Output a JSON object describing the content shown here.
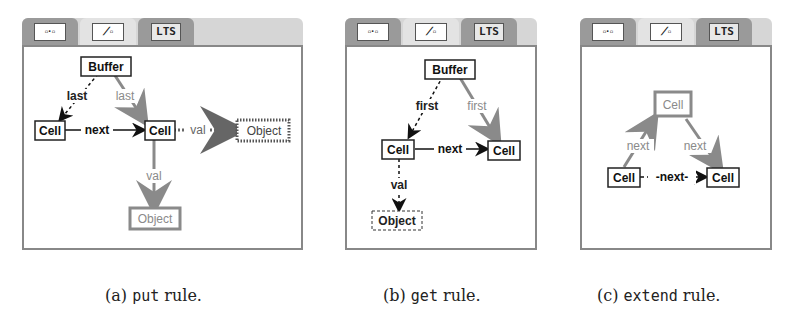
{
  "tabs": {
    "rule_view_icon": "rule-graph",
    "type_view_icon": "type-graph",
    "lts_label": "LTS"
  },
  "panels": [
    {
      "id": "a",
      "nodes": {
        "buffer": "Buffer",
        "cell_left": "Cell",
        "cell_mid": "Cell",
        "object_right": "Object",
        "object_bottom": "Object"
      },
      "edges": {
        "last_erased": "last",
        "last_created": "last",
        "next": "next",
        "val_nac": "val",
        "val_created": "val"
      },
      "caption": {
        "letter": "(a)",
        "rule": "put",
        "suffix": "rule."
      }
    },
    {
      "id": "b",
      "nodes": {
        "buffer": "Buffer",
        "cell_left": "Cell",
        "cell_right": "Cell",
        "object": "Object"
      },
      "edges": {
        "first_erased": "first",
        "first_created": "first",
        "next": "next",
        "val_erased": "val"
      },
      "caption": {
        "letter": "(b)",
        "rule": "get",
        "suffix": "rule."
      }
    },
    {
      "id": "c",
      "nodes": {
        "cell_top": "Cell",
        "cell_left": "Cell",
        "cell_right": "Cell"
      },
      "edges": {
        "next_left": "next",
        "next_right": "next",
        "next_erased": "-next-"
      },
      "caption": {
        "letter": "(c)",
        "rule": "extend",
        "suffix": "rule."
      }
    }
  ],
  "colors": {
    "reader": "#111111",
    "creator": "#8a8a8a",
    "eraser": "#333333",
    "nac": "#666666",
    "tab_inactive": "#9a9a9a",
    "tab_active": "#e3e3e3"
  }
}
